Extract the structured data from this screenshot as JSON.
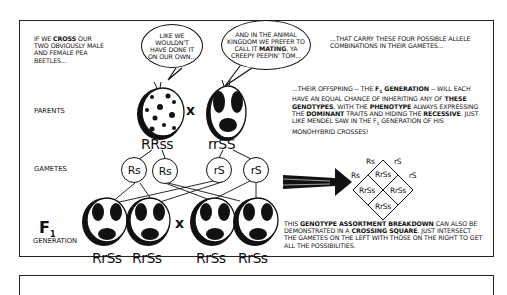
{
  "narration": {
    "top_left": [
      "IF WE ",
      "CROSS",
      " OUR TWO OBVIOUSLY MALE AND FEMALE PEA BEETLES..."
    ],
    "top_right": "...THAT CARRY THESE FOUR POSSIBLE ALLELE COMBINATIONS IN THEIR GAMETES...",
    "middle_right": {
      "p1": "...THEIR OFFSPRING -- THE ",
      "f1": "F",
      "f1_sub": "1",
      "p2": " GENERATION",
      "p3": " -- WILL EACH HAVE AN EQUAL CHANCE OF INHERITING ANY OF ",
      "p4": "THESE GENOTYPES",
      "p5": ", WITH THE ",
      "p6": "PHENOTYPE",
      "p7": " ALWAYS EXPRESSING THE ",
      "p8": "DOMINANT",
      "p9": " TRAITS AND HIDING THE ",
      "p10": "RECESSIVE",
      "p11": ". JUST LIKE MENDEL SAW IN THE F",
      "p12": "1",
      "p13": " GENERATION OF HIS MONOHYBRID CROSSES!"
    },
    "bottom_right": {
      "p1": "THIS ",
      "p2": "GENOTYPE ASSORTMENT BREAKDOWN",
      "p3": " CAN ALSO BE DEMONSTRATED IN A ",
      "p4": "CROSSING SQUARE",
      "p5": ". JUST INTERSECT THE GAMETES ON THE LEFT WITH THOSE ON THE RIGHT TO GET ALL THE POSSIBILITIES."
    }
  },
  "speech": {
    "left_beetle": "LIKE WE WOULDN'T HAVE DONE IT ON OUR OWN...",
    "right_beetle_a": "AND IN THE ANIMAL KINGDOM WE PREFER TO CALL IT ",
    "right_beetle_bold": "MATING",
    "right_beetle_b": ", YA CREEPY PEEPIN' TOM..."
  },
  "row_labels": {
    "parents": "PARENTS",
    "gametes": "GAMETES",
    "f1_main": "F",
    "f1_sub": "1",
    "generation": "GENERATION"
  },
  "parents": [
    {
      "genotype": "RRss",
      "pattern": "spotted"
    },
    {
      "genotype": "rrSS",
      "pattern": "blotched"
    }
  ],
  "cross_symbol": "x",
  "gametes": [
    "Rs",
    "Rs",
    "rS",
    "rS"
  ],
  "f1_offspring": [
    "RrSs",
    "RrSs",
    "RrSs",
    "RrSs"
  ],
  "crossing_square": {
    "left_labels": [
      "Rs",
      "Rs"
    ],
    "right_labels": [
      "rS",
      "rS"
    ],
    "cells": [
      "RrSs",
      "RrSs",
      "RrSs",
      "RrSs"
    ]
  },
  "colors": {
    "ink": "#111111",
    "paper": "#ffffff"
  }
}
